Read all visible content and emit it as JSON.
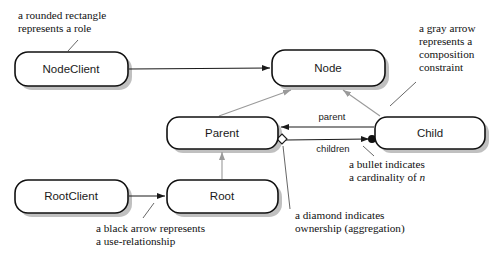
{
  "diagram": {
    "colors": {
      "box_stroke": "#111111",
      "box_fill": "#ffffff",
      "black_arrow": "#1a1a1a",
      "gray_arrow": "#9a9a9a",
      "text": "#111111",
      "shadow": "#8c8c8c"
    },
    "nodes": [
      {
        "id": "nodeclient",
        "label": "NodeClient",
        "x": 15,
        "y": 52,
        "w": 113,
        "h": 34
      },
      {
        "id": "node",
        "label": "Node",
        "x": 272,
        "y": 50,
        "w": 113,
        "h": 36
      },
      {
        "id": "parent",
        "label": "Parent",
        "x": 167,
        "y": 117,
        "w": 111,
        "h": 32
      },
      {
        "id": "child",
        "label": "Child",
        "x": 375,
        "y": 117,
        "w": 110,
        "h": 32
      },
      {
        "id": "rootclient",
        "label": "RootClient",
        "x": 15,
        "y": 180,
        "w": 113,
        "h": 33
      },
      {
        "id": "root",
        "label": "Root",
        "x": 167,
        "y": 180,
        "w": 111,
        "h": 33
      }
    ],
    "edges": [
      {
        "id": "nodeclient-to-node",
        "from": "nodeclient",
        "to": "node",
        "label": "",
        "kind": "use-relationship",
        "color": "black"
      },
      {
        "id": "rootclient-to-root",
        "from": "rootclient",
        "to": "root",
        "label": "",
        "kind": "use-relationship",
        "color": "black"
      },
      {
        "id": "child-to-parent",
        "from": "child",
        "to": "parent",
        "label": "parent",
        "kind": "use-relationship",
        "color": "black"
      },
      {
        "id": "parent-to-child",
        "from": "parent",
        "to": "child",
        "label": "children",
        "kind": "aggregation-cardinality-n",
        "color": "black"
      },
      {
        "id": "parent-to-node",
        "from": "parent",
        "to": "node",
        "label": "",
        "kind": "composition-constraint",
        "color": "gray"
      },
      {
        "id": "child-to-node",
        "from": "child",
        "to": "node",
        "label": "",
        "kind": "composition-constraint",
        "color": "gray"
      },
      {
        "id": "root-to-parent",
        "from": "root",
        "to": "parent",
        "label": "",
        "kind": "composition-constraint",
        "color": "gray"
      }
    ],
    "annotations": [
      {
        "id": "rounded-rectangle-note",
        "lines": [
          "a rounded rectangle",
          "represents a role"
        ],
        "x": 18,
        "y": 19
      },
      {
        "id": "gray-arrow-note",
        "lines": [
          "a gray arrow",
          "represents a",
          "composition",
          "constraint"
        ],
        "x": 419,
        "y": 32
      },
      {
        "id": "bullet-note",
        "lines": [
          "a bullet indicates",
          "a cardinality of "
        ],
        "italic_suffix": "n",
        "x": 349,
        "y": 168
      },
      {
        "id": "diamond-note",
        "lines": [
          "a diamond indicates",
          "ownership (aggregation)"
        ],
        "x": 295,
        "y": 219
      },
      {
        "id": "black-arrow-note",
        "lines": [
          "a black arrow represents",
          "a use-relationship"
        ],
        "x": 96,
        "y": 232
      }
    ],
    "markers": [
      {
        "id": "aggregation-diamond",
        "shape": "diamond",
        "x": 282,
        "y": 139,
        "meaning": "ownership (aggregation)"
      },
      {
        "id": "cardinality-bullet",
        "shape": "filled-circle",
        "x": 372,
        "y": 139,
        "meaning": "cardinality of n"
      }
    ]
  }
}
